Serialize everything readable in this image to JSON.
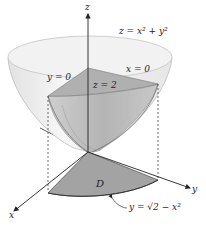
{
  "diagram": {
    "surface_label": "z = x² + y²",
    "labels": {
      "z_axis": "z",
      "x_axis": "x",
      "y_axis": "y",
      "plane_y0": "y = 0",
      "plane_x0": "x = 0",
      "plane_z2": "z = 2",
      "region": "D",
      "boundary_curve": "y = √2 − x²"
    },
    "colors": {
      "bowl_fill": "#eeeeee",
      "bowl_edge": "#bbbbbb",
      "solid_fill": "#b9b9b9",
      "region_fill": "#9e9e9e",
      "axis": "#222222"
    }
  }
}
